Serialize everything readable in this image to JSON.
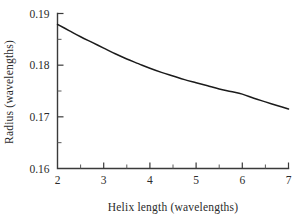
{
  "chart_data": {
    "type": "line",
    "title": "",
    "xlabel": "Helix length (wavelengths)",
    "ylabel": "Radius (wavelengths)",
    "xlim": [
      2,
      7
    ],
    "ylim": [
      0.16,
      0.19
    ],
    "grid": false,
    "legend": "none",
    "x_ticks": [
      2,
      3,
      4,
      5,
      6,
      7
    ],
    "x_tick_labels": [
      "2",
      "3",
      "4",
      "5",
      "6",
      "7"
    ],
    "x_minor_ticks": [
      2.5,
      3.5,
      4.5,
      5.5,
      6.5
    ],
    "y_ticks": [
      0.16,
      0.17,
      0.18,
      0.19
    ],
    "y_tick_labels": [
      "0.16",
      "0.17",
      "0.18",
      "0.19"
    ],
    "y_minor_ticks": [
      0.165,
      0.175,
      0.185
    ],
    "series": [
      {
        "name": "radius",
        "x": [
          2.0,
          2.25,
          2.5,
          2.75,
          3.0,
          3.25,
          3.5,
          3.75,
          4.0,
          4.25,
          4.5,
          4.75,
          5.0,
          5.25,
          5.5,
          5.75,
          6.0,
          6.25,
          6.5,
          6.75,
          7.0
        ],
        "values": [
          0.1879,
          0.1867,
          0.1855,
          0.1844,
          0.1833,
          0.1822,
          0.1812,
          0.1803,
          0.1794,
          0.1786,
          0.1779,
          0.1772,
          0.1766,
          0.176,
          0.1754,
          0.1749,
          0.1744,
          0.1736,
          0.1729,
          0.1722,
          0.1715
        ]
      }
    ],
    "curve_color": "#1b1b1b",
    "axis_color": "#3a3a3a",
    "background_color": "#ffffff"
  },
  "figure": {
    "x_axis_label": "Helix length (wavelengths)",
    "y_axis_label": "Radius (wavelengths)"
  }
}
